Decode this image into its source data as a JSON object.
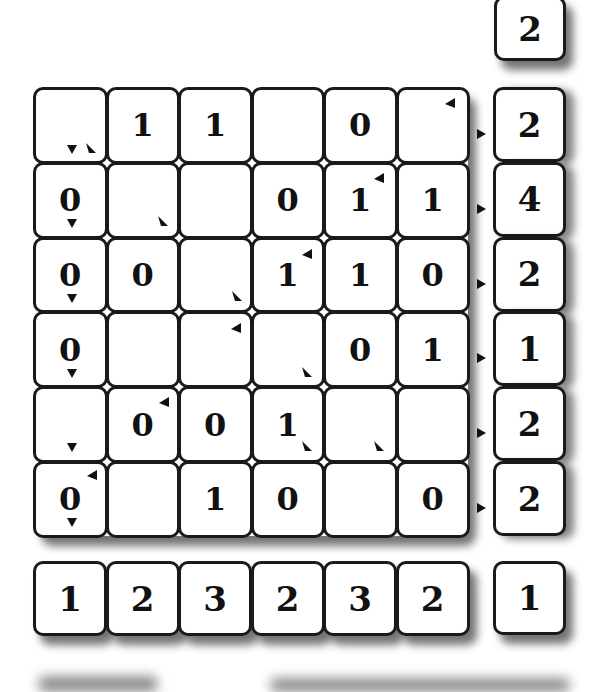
{
  "puzzle": {
    "top_clue": "2",
    "grid": [
      [
        "",
        "1",
        "1",
        "",
        "0",
        ""
      ],
      [
        "0",
        "",
        "",
        "0",
        "1",
        "1"
      ],
      [
        "0",
        "0",
        "",
        "1",
        "1",
        "0"
      ],
      [
        "0",
        "",
        "",
        "",
        "0",
        "1"
      ],
      [
        "",
        "0",
        "0",
        "1",
        "",
        ""
      ],
      [
        "0",
        "",
        "1",
        "0",
        "",
        "0"
      ]
    ],
    "row_clues": [
      "2",
      "4",
      "2",
      "1",
      "2",
      "2"
    ],
    "column_clues": [
      "1",
      "2",
      "3",
      "2",
      "3",
      "2"
    ],
    "corner_clue": "1"
  }
}
